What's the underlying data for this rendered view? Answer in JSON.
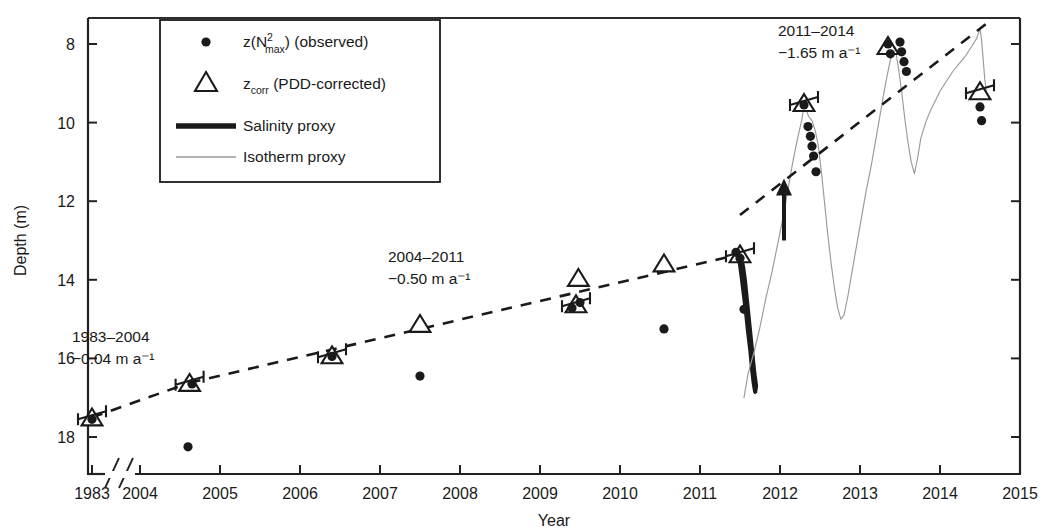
{
  "chart_data": {
    "type": "scatter",
    "title": "",
    "xlabel": "Year",
    "ylabel": "Depth (m)",
    "xlim": [
      2003.55,
      2015.0
    ],
    "ylim_inverted": [
      7.2,
      18.8
    ],
    "y_axis_inverted": true,
    "grid": false,
    "axis_break": {
      "present": true,
      "between": [
        1983,
        2004
      ],
      "style": "double-slash"
    },
    "xticks": [
      1983,
      2004,
      2005,
      2006,
      2007,
      2008,
      2009,
      2010,
      2011,
      2012,
      2013,
      2014,
      2015
    ],
    "yticks": [
      8,
      10,
      12,
      14,
      16,
      18
    ],
    "legend": {
      "position": "top-left",
      "entries": [
        {
          "marker": "dot",
          "label_prefix": "z(N",
          "label_sup": "2",
          "label_sub": "max",
          "label_suffix": ") (observed)"
        },
        {
          "marker": "triangle",
          "label_prefix": "z",
          "label_sub": "corr",
          "label_suffix": " (PDD-corrected)"
        },
        {
          "marker": "thick-line",
          "label": "Salinity proxy"
        },
        {
          "marker": "thin-line",
          "label": "Isotherm proxy"
        }
      ]
    },
    "annotations": [
      {
        "id": "trend-1983-2004",
        "period": "1983–2004",
        "rate": "−0.04 m a⁻¹",
        "x_px": 72,
        "y_px": 342
      },
      {
        "id": "trend-2004-2011",
        "period": "2004–2011",
        "rate": "−0.50 m a⁻¹",
        "x_px": 388,
        "y_px": 262
      },
      {
        "id": "trend-2011-2014",
        "period": "2011–2014",
        "rate": "−1.65 m a⁻¹",
        "x_px": 778,
        "y_px": 36
      },
      {
        "id": "event-arrow-2012",
        "type": "arrow",
        "x": 2012.05,
        "y_top": 13.0,
        "y_bottom": 11.6
      }
    ],
    "series": [
      {
        "name": "z(N2max) (observed)",
        "marker": "dot",
        "points": [
          {
            "x": 1983.2,
            "y": 17.55
          },
          {
            "x": 2004.6,
            "y": 18.25
          },
          {
            "x": 2004.65,
            "y": 16.65
          },
          {
            "x": 2006.4,
            "y": 15.95
          },
          {
            "x": 2007.5,
            "y": 16.45
          },
          {
            "x": 2009.4,
            "y": 14.72
          },
          {
            "x": 2009.5,
            "y": 14.58
          },
          {
            "x": 2010.55,
            "y": 15.25
          },
          {
            "x": 2011.45,
            "y": 13.3
          },
          {
            "x": 2011.5,
            "y": 13.45
          },
          {
            "x": 2011.55,
            "y": 14.75
          },
          {
            "x": 2012.3,
            "y": 9.55
          },
          {
            "x": 2012.35,
            "y": 10.1
          },
          {
            "x": 2012.38,
            "y": 10.35
          },
          {
            "x": 2012.4,
            "y": 10.6
          },
          {
            "x": 2012.42,
            "y": 10.85
          },
          {
            "x": 2012.45,
            "y": 11.25
          },
          {
            "x": 2013.35,
            "y": 8.0
          },
          {
            "x": 2013.38,
            "y": 8.25
          },
          {
            "x": 2013.5,
            "y": 7.95
          },
          {
            "x": 2013.52,
            "y": 8.2
          },
          {
            "x": 2013.55,
            "y": 8.45
          },
          {
            "x": 2013.58,
            "y": 8.7
          },
          {
            "x": 2014.5,
            "y": 9.6
          },
          {
            "x": 2014.52,
            "y": 9.95
          }
        ]
      },
      {
        "name": "z_corr (PDD-corrected)",
        "marker": "triangle",
        "points": [
          {
            "x": 1983.2,
            "y": 17.5,
            "err": true
          },
          {
            "x": 2004.62,
            "y": 16.62,
            "err": true
          },
          {
            "x": 2006.4,
            "y": 15.92,
            "err": true
          },
          {
            "x": 2007.5,
            "y": 15.12,
            "err": false
          },
          {
            "x": 2009.45,
            "y": 14.62,
            "err": true
          },
          {
            "x": 2009.48,
            "y": 13.95,
            "err": false
          },
          {
            "x": 2010.55,
            "y": 13.58,
            "err": false
          },
          {
            "x": 2011.5,
            "y": 13.35,
            "err": true
          },
          {
            "x": 2012.3,
            "y": 9.5,
            "err": true
          },
          {
            "x": 2013.35,
            "y": 8.05,
            "err": false
          },
          {
            "x": 2014.5,
            "y": 9.2,
            "err": true
          }
        ]
      }
    ],
    "trend_lines": [
      {
        "name": "1983–2004 trend",
        "style": "dashed",
        "x1": 1983.2,
        "y1": 17.5,
        "x2": 2004.62,
        "y2": 16.62
      },
      {
        "name": "2004–2011 trend",
        "style": "dashed",
        "x1": 2004.62,
        "y1": 16.62,
        "x2": 2011.5,
        "y2": 13.35
      },
      {
        "name": "2011–2014 trend",
        "style": "dashed",
        "x1": 2011.5,
        "y1": 12.35,
        "x2": 2014.6,
        "y2": 7.45
      }
    ],
    "proxy_curves": [
      {
        "name": "Salinity proxy",
        "style": "thick",
        "points": [
          [
            2011.47,
            13.3
          ],
          [
            2011.49,
            13.45
          ],
          [
            2011.5,
            13.6
          ],
          [
            2011.52,
            13.9
          ],
          [
            2011.55,
            14.4
          ],
          [
            2011.58,
            14.9
          ],
          [
            2011.6,
            15.3
          ],
          [
            2011.63,
            15.8
          ],
          [
            2011.65,
            16.25
          ],
          [
            2011.67,
            16.6
          ],
          [
            2011.69,
            16.85
          ],
          [
            2011.7,
            16.7
          ],
          [
            2011.68,
            16.4
          ],
          [
            2011.66,
            16.0
          ],
          [
            2011.64,
            15.6
          ],
          [
            2011.62,
            15.2
          ],
          [
            2011.6,
            14.8
          ],
          [
            2011.58,
            14.4
          ],
          [
            2011.56,
            14.0
          ],
          [
            2011.54,
            13.7
          ],
          [
            2011.52,
            13.5
          ],
          [
            2011.5,
            13.35
          ]
        ]
      },
      {
        "name": "Isotherm proxy",
        "style": "thin",
        "points": [
          [
            2011.55,
            17.0
          ],
          [
            2011.6,
            16.4
          ],
          [
            2011.68,
            15.8
          ],
          [
            2011.75,
            15.2
          ],
          [
            2011.82,
            14.5
          ],
          [
            2011.9,
            13.8
          ],
          [
            2011.97,
            13.1
          ],
          [
            2012.04,
            12.4
          ],
          [
            2012.1,
            11.7
          ],
          [
            2012.16,
            11.0
          ],
          [
            2012.22,
            10.4
          ],
          [
            2012.27,
            9.95
          ],
          [
            2012.3,
            9.6
          ],
          [
            2012.33,
            9.7
          ],
          [
            2012.36,
            9.85
          ],
          [
            2012.4,
            9.95
          ],
          [
            2012.44,
            10.2
          ],
          [
            2012.48,
            10.6
          ],
          [
            2012.52,
            11.3
          ],
          [
            2012.56,
            12.1
          ],
          [
            2012.6,
            12.9
          ],
          [
            2012.64,
            13.6
          ],
          [
            2012.68,
            14.2
          ],
          [
            2012.72,
            14.7
          ],
          [
            2012.76,
            15.0
          ],
          [
            2012.8,
            14.9
          ],
          [
            2012.85,
            14.4
          ],
          [
            2012.9,
            13.8
          ],
          [
            2012.96,
            13.1
          ],
          [
            2013.02,
            12.4
          ],
          [
            2013.08,
            11.7
          ],
          [
            2013.14,
            11.1
          ],
          [
            2013.2,
            10.4
          ],
          [
            2013.26,
            9.7
          ],
          [
            2013.32,
            9.0
          ],
          [
            2013.38,
            8.4
          ],
          [
            2013.44,
            8.1
          ],
          [
            2013.48,
            8.6
          ],
          [
            2013.52,
            9.2
          ],
          [
            2013.56,
            9.9
          ],
          [
            2013.6,
            10.5
          ],
          [
            2013.64,
            11.0
          ],
          [
            2013.68,
            11.3
          ],
          [
            2013.72,
            10.9
          ],
          [
            2013.76,
            10.4
          ],
          [
            2013.82,
            10.0
          ],
          [
            2013.88,
            9.7
          ],
          [
            2013.94,
            9.45
          ],
          [
            2014.0,
            9.2
          ],
          [
            2014.08,
            8.95
          ],
          [
            2014.16,
            8.7
          ],
          [
            2014.24,
            8.5
          ],
          [
            2014.32,
            8.3
          ],
          [
            2014.4,
            8.05
          ],
          [
            2014.46,
            7.85
          ],
          [
            2014.5,
            7.6
          ],
          [
            2014.52,
            7.9
          ],
          [
            2014.54,
            8.4
          ],
          [
            2014.56,
            8.9
          ],
          [
            2014.58,
            9.2
          ]
        ]
      }
    ]
  },
  "axis": {
    "ylabel": "Depth (m)",
    "xlabel": "Year",
    "xticklabels": [
      "1983",
      "2004",
      "2005",
      "2006",
      "2007",
      "2008",
      "2009",
      "2010",
      "2011",
      "2012",
      "2013",
      "2014",
      "2015"
    ],
    "yticklabels": [
      "8",
      "10",
      "12",
      "14",
      "16",
      "18"
    ]
  },
  "legend": {
    "item1": {
      "prefix": "z(N",
      "sup": "2",
      "sub": "max",
      "suffix": ") (observed)"
    },
    "item2": {
      "prefix": "z",
      "sub": "corr",
      "suffix": " (PDD-corrected)"
    },
    "item3": {
      "label": "Salinity proxy"
    },
    "item4": {
      "label": "Isotherm proxy"
    }
  },
  "annotations": {
    "a1": {
      "line1": "1983–2004",
      "line2": "−0.04 m a⁻¹"
    },
    "a2": {
      "line1": "2004–2011",
      "line2": "−0.50 m a⁻¹"
    },
    "a3": {
      "line1": "2011–2014",
      "line2": "−1.65 m a⁻¹"
    }
  },
  "colors": {
    "ink": "#1a1a1a",
    "proxy_thin": "#9a9a9a",
    "axis": "#222222"
  }
}
